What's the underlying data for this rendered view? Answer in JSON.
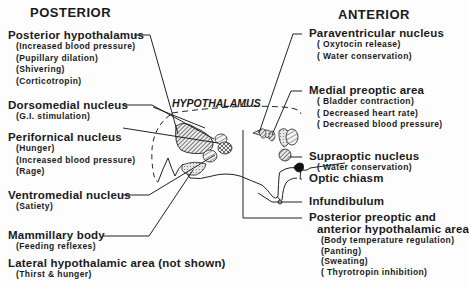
{
  "headers": {
    "posterior": "POSTERIOR",
    "anterior": "ANTERIOR"
  },
  "region_label": "HYPOTHALAMUS",
  "left_labels": [
    {
      "name": "Posterior hypothalamus",
      "functions": [
        "(Increased blood pressure)",
        "(Pupillary dilation)",
        "(Shivering)",
        "(Corticotropin)"
      ]
    },
    {
      "name": "Dorsomedial nucleus",
      "functions": [
        "(G.I. stimulation)"
      ]
    },
    {
      "name": "Perifornical nucleus",
      "functions": [
        "(Hunger)",
        "(Increased blood pressure)",
        "(Rage)"
      ]
    },
    {
      "name": "Ventromedial nucleus",
      "functions": [
        "(Satiety)"
      ]
    },
    {
      "name": "Mammillary body",
      "functions": [
        "(Feeding reflexes)"
      ]
    },
    {
      "name": "Lateral hypothalamic area (not shown)",
      "functions": [
        "(Thirst & hunger)"
      ]
    }
  ],
  "right_labels": [
    {
      "name": "Paraventricular nucleus",
      "functions": [
        "( Oxytocin release)",
        "( Water conservation)"
      ]
    },
    {
      "name": "Medial preoptic area",
      "functions": [
        "( Bladder contraction)",
        "( Decreased heart rate)",
        "( Decreased blood pressure)"
      ]
    },
    {
      "name": "Supraoptic nucleus",
      "functions": [
        "( Water conservation)"
      ]
    },
    {
      "name": "Optic chiasm",
      "functions": []
    },
    {
      "name": "Infundibulum",
      "functions": []
    },
    {
      "name": "Posterior preoptic and",
      "name2": "anterior hypothalamic area",
      "functions": [
        "(Body temperature regulation)",
        "(Panting)",
        "(Sweating)",
        "( Thyrotropin inhibition)"
      ]
    }
  ]
}
